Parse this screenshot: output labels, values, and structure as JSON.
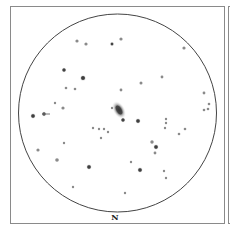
{
  "sketch": {
    "orientation_label": "N",
    "field_circle": {
      "cx": 117.5,
      "cy": 113,
      "r": 99
    },
    "galaxy": {
      "cx": 119,
      "cy": 110,
      "rx": 6,
      "ry": 10,
      "rotation": -30
    },
    "arrow": {
      "x1": 42,
      "y1": 114,
      "x2": 50,
      "y2": 114
    },
    "stars": [
      {
        "x": 77,
        "y": 41,
        "r": 1.2
      },
      {
        "x": 86,
        "y": 44,
        "r": 1.2
      },
      {
        "x": 112,
        "y": 44,
        "r": 1.5
      },
      {
        "x": 121,
        "y": 39,
        "r": 1.2
      },
      {
        "x": 184,
        "y": 48,
        "r": 1.2
      },
      {
        "x": 64,
        "y": 70,
        "r": 1.8
      },
      {
        "x": 83,
        "y": 78,
        "r": 2.2
      },
      {
        "x": 66,
        "y": 88,
        "r": 0.9
      },
      {
        "x": 75,
        "y": 89,
        "r": 0.9
      },
      {
        "x": 141,
        "y": 83,
        "r": 1.1
      },
      {
        "x": 162,
        "y": 77,
        "r": 1.0
      },
      {
        "x": 121,
        "y": 90,
        "r": 1.0
      },
      {
        "x": 204,
        "y": 93,
        "r": 1.0
      },
      {
        "x": 209,
        "y": 104,
        "r": 0.9
      },
      {
        "x": 204,
        "y": 110,
        "r": 0.9
      },
      {
        "x": 208,
        "y": 109,
        "r": 0.9
      },
      {
        "x": 55,
        "y": 103,
        "r": 0.8
      },
      {
        "x": 63,
        "y": 108,
        "r": 1.2
      },
      {
        "x": 112,
        "y": 108,
        "r": 0.8
      },
      {
        "x": 33,
        "y": 116,
        "r": 2.0
      },
      {
        "x": 44,
        "y": 114,
        "r": 1.8
      },
      {
        "x": 123,
        "y": 120,
        "r": 1.8
      },
      {
        "x": 138,
        "y": 121,
        "r": 2.0
      },
      {
        "x": 166,
        "y": 119,
        "r": 0.8
      },
      {
        "x": 166,
        "y": 123,
        "r": 0.8
      },
      {
        "x": 165,
        "y": 128,
        "r": 0.8
      },
      {
        "x": 185,
        "y": 129,
        "r": 0.9
      },
      {
        "x": 179,
        "y": 134,
        "r": 0.9
      },
      {
        "x": 93,
        "y": 128,
        "r": 0.8
      },
      {
        "x": 99,
        "y": 129,
        "r": 0.8
      },
      {
        "x": 104,
        "y": 129,
        "r": 0.8
      },
      {
        "x": 108,
        "y": 132,
        "r": 0.8
      },
      {
        "x": 101,
        "y": 138,
        "r": 0.8
      },
      {
        "x": 64,
        "y": 143,
        "r": 0.8
      },
      {
        "x": 38,
        "y": 150,
        "r": 1.2
      },
      {
        "x": 152,
        "y": 142,
        "r": 1.3
      },
      {
        "x": 156,
        "y": 147,
        "r": 2.0
      },
      {
        "x": 155,
        "y": 153,
        "r": 1.0
      },
      {
        "x": 57,
        "y": 160,
        "r": 1.4
      },
      {
        "x": 131,
        "y": 162,
        "r": 0.8
      },
      {
        "x": 89,
        "y": 167,
        "r": 2.0
      },
      {
        "x": 140,
        "y": 170,
        "r": 2.0
      },
      {
        "x": 164,
        "y": 171,
        "r": 0.8
      },
      {
        "x": 166,
        "y": 178,
        "r": 0.8
      },
      {
        "x": 73,
        "y": 187,
        "r": 0.8
      },
      {
        "x": 125,
        "y": 193,
        "r": 0.8
      }
    ]
  }
}
